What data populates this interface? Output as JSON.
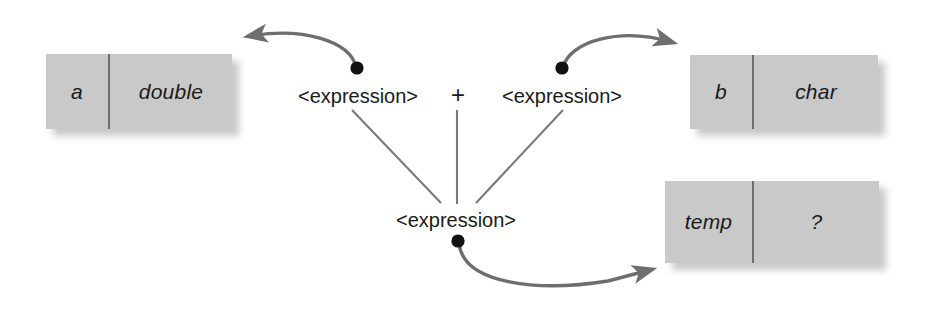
{
  "diagram": {
    "colors": {
      "box_fill": "#c9c9c9",
      "box_divider": "#6e6e6e",
      "tree_line": "#7a7a7a",
      "arrow": "#6e6e6e",
      "dot": "#111111",
      "text": "#1a1a1a",
      "background": "#ffffff"
    },
    "variable_boxes": [
      {
        "id": "box-a",
        "name": "a",
        "type": "double"
      },
      {
        "id": "box-b",
        "name": "b",
        "type": "char"
      },
      {
        "id": "box-temp",
        "name": "temp",
        "type": "?"
      }
    ],
    "expressions": {
      "left_operand": "<expression>",
      "operator": "+",
      "right_operand": "<expression>",
      "result": "<expression>"
    },
    "connectors": [
      {
        "id": "arrow-left-expression-to-a",
        "from": "left_operand",
        "to": "box-a"
      },
      {
        "id": "arrow-right-expression-to-b",
        "from": "right_operand",
        "to": "box-b"
      },
      {
        "id": "arrow-result-to-temp",
        "from": "result",
        "to": "box-temp"
      }
    ]
  }
}
